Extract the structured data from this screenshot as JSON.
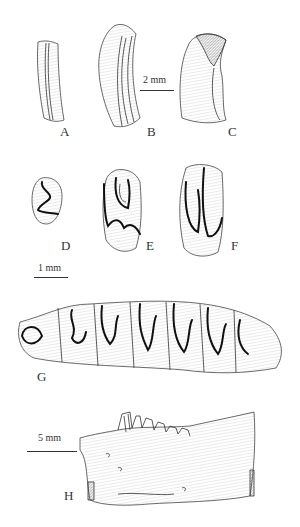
{
  "figure": {
    "panels": [
      {
        "id": "A",
        "label": "A",
        "description": "isolated incisor fragment, narrow"
      },
      {
        "id": "B",
        "label": "B",
        "description": "incisor, curved, lateral view"
      },
      {
        "id": "C",
        "label": "C",
        "description": "incisor with broken tip, hatched region"
      },
      {
        "id": "D",
        "label": "D",
        "description": "small cheek tooth, occlusal view"
      },
      {
        "id": "E",
        "label": "E",
        "description": "cheek tooth with enamel folds"
      },
      {
        "id": "F",
        "label": "F",
        "description": "elongate cheek tooth with two folds"
      },
      {
        "id": "G",
        "label": "G",
        "description": "tooth row, occlusal view"
      },
      {
        "id": "H",
        "label": "H",
        "description": "mandible fragment with teeth, lateral view"
      }
    ],
    "scale_bars": [
      {
        "id": "scale-2mm",
        "label": "2 mm",
        "applies_to": "A-C"
      },
      {
        "id": "scale-1mm",
        "label": "1 mm",
        "applies_to": "D-G"
      },
      {
        "id": "scale-5mm",
        "label": "5 mm",
        "applies_to": "H"
      }
    ]
  }
}
